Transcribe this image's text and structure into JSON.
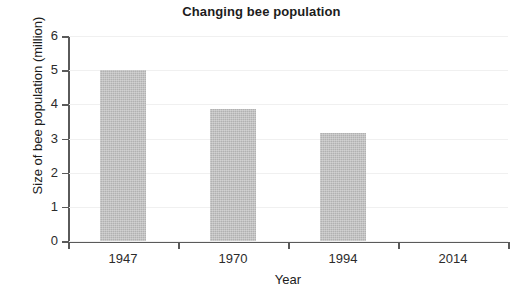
{
  "chart_data": {
    "type": "bar",
    "title": "Changing bee population",
    "xlabel": "Year",
    "ylabel": "Size of bee population (million)",
    "categories": [
      "1947",
      "1970",
      "1994",
      "2014"
    ],
    "values": [
      5.0,
      3.87,
      3.15,
      null
    ],
    "ylim": [
      0,
      6
    ],
    "yticks": [
      0,
      1,
      2,
      3,
      4,
      5,
      6
    ],
    "ytick_labels": [
      "0",
      "1",
      "2",
      "3",
      "4",
      "5",
      "6"
    ],
    "grid": true,
    "legend": "none",
    "series": [
      {
        "name": "Size of bee population (million)",
        "values": [
          5.0,
          3.87,
          3.15,
          null
        ],
        "color": "#b9b9b9"
      }
    ]
  },
  "colors": {
    "bar_fill": "#b9b9b9",
    "axis": "#5a5a5a",
    "grid": "#f0f0f0",
    "text": "#1c1c1c",
    "background": "#ffffff"
  }
}
